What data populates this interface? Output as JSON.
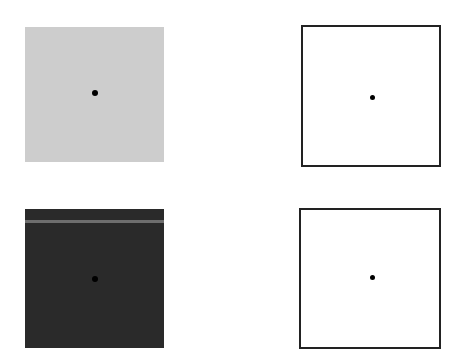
{
  "figure": {
    "panels": [
      {
        "id": "top-left",
        "fill": "#cdcdcd",
        "border": "none",
        "fixation_dot": true
      },
      {
        "id": "top-right",
        "fill": "#ffffff",
        "border": "#222222",
        "fixation_dot": true
      },
      {
        "id": "bottom-left",
        "fill": "#2a2a2a",
        "border": "none",
        "stripe_color": "#6e6e6e",
        "fixation_dot": true
      },
      {
        "id": "bottom-right",
        "fill": "#ffffff",
        "border": "#222222",
        "fixation_dot": true
      }
    ]
  }
}
